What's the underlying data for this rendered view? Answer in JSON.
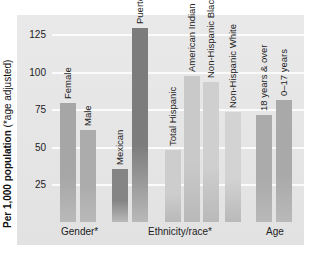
{
  "chart_data": {
    "type": "bar",
    "title": "",
    "xlabel": "",
    "ylabel": "Per 1,000 population (*age adjusted)",
    "ylabel_bold": "Per 1,000 population",
    "ylabel_note": "(*age adjusted)",
    "ylim": [
      0,
      135
    ],
    "yticks": [
      25,
      50,
      75,
      100,
      125
    ],
    "grid": true,
    "groups": [
      {
        "label": "Gender*",
        "categories": [
          "Female",
          "Male"
        ]
      },
      {
        "label": "Ethnicity/race*",
        "categories": [
          "Mexican",
          "Puerto Rican",
          "Total Hispanic",
          "American Indian",
          "Non-Hispanic Black",
          "Non-Hispanic White"
        ]
      },
      {
        "label": "Age",
        "categories": [
          "18 years & over",
          "0–17 years"
        ]
      }
    ],
    "categories": [
      "Female",
      "Male",
      "Mexican",
      "Puerto Rican",
      "Total Hispanic",
      "American Indian",
      "Non-Hispanic Black",
      "Non-Hispanic White",
      "18 years & over",
      "0–17 years"
    ],
    "values": [
      79,
      61,
      35,
      129,
      48,
      97,
      93,
      73,
      71,
      81
    ]
  },
  "axis": {
    "ticks": [
      "25",
      "50",
      "75",
      "100",
      "125"
    ]
  },
  "bars": [
    {
      "label": "Female",
      "value": 79,
      "color": "#a6a6a6",
      "x": 8
    },
    {
      "label": "Male",
      "value": 61,
      "color": "#acacac",
      "x": 28
    },
    {
      "label": "Mexican",
      "value": 35,
      "color": "#858585",
      "x": 60
    },
    {
      "label": "Puerto Rican",
      "value": 129,
      "color": "#7c7c7c",
      "x": 80
    },
    {
      "label": "Total Hispanic",
      "value": 48,
      "color": "#cdcdcd",
      "x": 113
    },
    {
      "label": "American Indian",
      "value": 97,
      "color": "#c9c9c9",
      "x": 132
    },
    {
      "label": "Non-Hispanic Black",
      "value": 93,
      "color": "#cfcfcf",
      "x": 151
    },
    {
      "label": "Non-Hispanic White",
      "value": 73,
      "color": "#d3d3d3",
      "x": 173
    },
    {
      "label": "18 years & over",
      "value": 71,
      "color": "#ababab",
      "x": 204
    },
    {
      "label": "0–17 years",
      "value": 81,
      "color": "#a9a9a9",
      "x": 224
    }
  ],
  "groups": {
    "gender": "Gender*",
    "ethnicity": "Ethnicity/race*",
    "age": "Age"
  }
}
